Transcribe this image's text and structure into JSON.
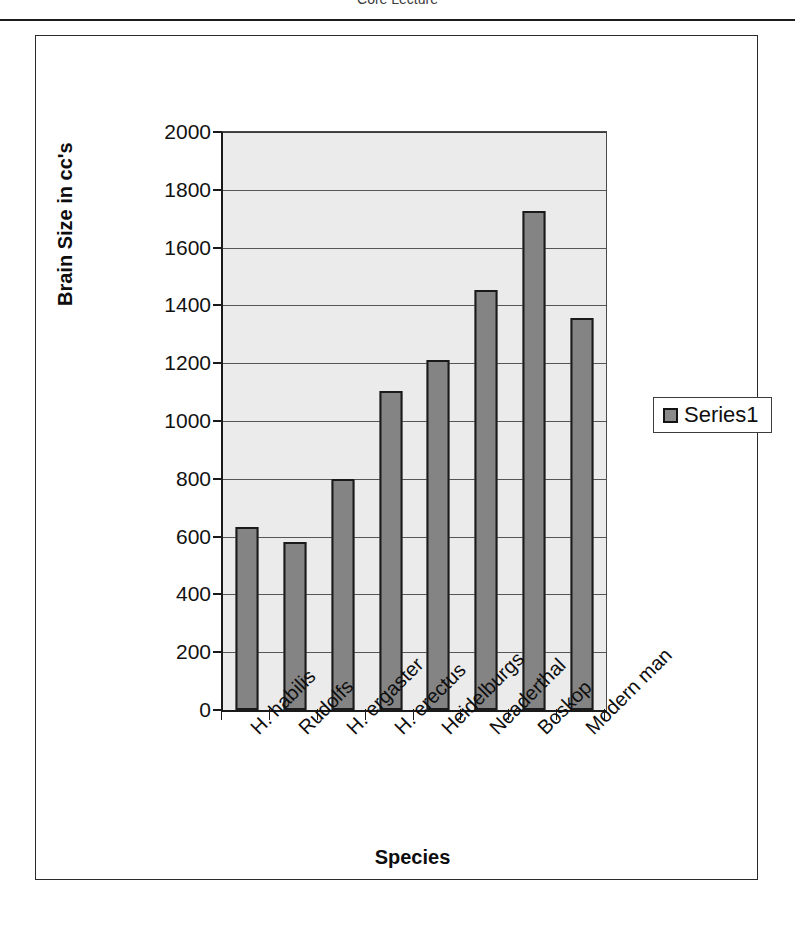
{
  "header": {
    "title": "Core Lecture"
  },
  "legend": {
    "position": "right",
    "entries": [
      {
        "label": "Series1",
        "swatch_color": "#8a8a8a",
        "icon": "square-swatch-icon"
      }
    ]
  },
  "colors": {
    "bar_fill": "#848484",
    "bar_border": "#1a1a1a",
    "plot_background": "#ebebeb",
    "gridline": "#555555",
    "axis": "#1a1a1a",
    "text": "#0d0d0d",
    "frame_border": "#2b2b2b"
  },
  "chart_data": {
    "type": "bar",
    "title": "",
    "xlabel": "Species",
    "ylabel": "Brain Size in cc's",
    "ylim": [
      0,
      2000
    ],
    "ytick_step": 200,
    "yticks": [
      0,
      200,
      400,
      600,
      800,
      1000,
      1200,
      1400,
      1600,
      1800,
      2000
    ],
    "ytick_labels": [
      "0",
      "200",
      "400",
      "600",
      "800",
      "1000",
      "1200",
      "1400",
      "1600",
      "1800",
      "2000"
    ],
    "grid": true,
    "legend_position": "right",
    "categories": [
      "H. habilis",
      "Rudolfs",
      "H. ergaster",
      "H. erectus",
      "Heidelburgs",
      "Neaderthal",
      "Boskop",
      "Modern man"
    ],
    "series": [
      {
        "name": "Series1",
        "values": [
          635,
          580,
          800,
          1105,
          1210,
          1455,
          1725,
          1355
        ]
      }
    ]
  }
}
